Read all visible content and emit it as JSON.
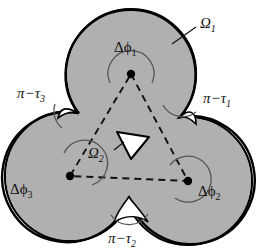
{
  "figure": {
    "background_color": "#ffffff",
    "disc_fill_color": "#b0b0b0",
    "outline_color": "#000000",
    "arc_color": "#555555",
    "dash_color": "#111111",
    "inner_triangle_fill": "#ffffff"
  },
  "labels": {
    "omega_1": {
      "symbol": "Ω",
      "subscript": "1"
    },
    "omega_2": {
      "symbol": "Ω",
      "subscript": "2"
    },
    "delta_phi_1": {
      "symbol": "Δϕ",
      "subscript": "1"
    },
    "delta_phi_2": {
      "symbol": "Δϕ",
      "subscript": "2"
    },
    "delta_phi_3": {
      "symbol": "Δϕ",
      "subscript": "3"
    },
    "pi_minus_tau_1": {
      "symbol": "π−τ",
      "subscript": "1"
    },
    "pi_minus_tau_2": {
      "symbol": "π−τ",
      "subscript": "2"
    },
    "pi_minus_tau_3": {
      "symbol": "π−τ",
      "subscript": "3"
    }
  },
  "geometry": {
    "discs": [
      {
        "name": "top-disc",
        "cx": 131,
        "cy": 74,
        "r": 65
      },
      {
        "name": "bottom-right-disc",
        "cx": 188,
        "cy": 181,
        "r": 64
      },
      {
        "name": "bottom-left-disc",
        "cx": 70,
        "cy": 176,
        "r": 65
      }
    ],
    "vertices": [
      {
        "name": "vertex-1",
        "x": 131,
        "y": 74
      },
      {
        "name": "vertex-2",
        "x": 188,
        "y": 181
      },
      {
        "name": "vertex-3",
        "x": 70,
        "y": 176
      }
    ],
    "cusps": [
      {
        "name": "cusp-1",
        "x": 180,
        "y": 117
      },
      {
        "name": "cusp-2",
        "x": 129,
        "y": 197
      },
      {
        "name": "cusp-3",
        "x": 78,
        "y": 113
      }
    ]
  }
}
